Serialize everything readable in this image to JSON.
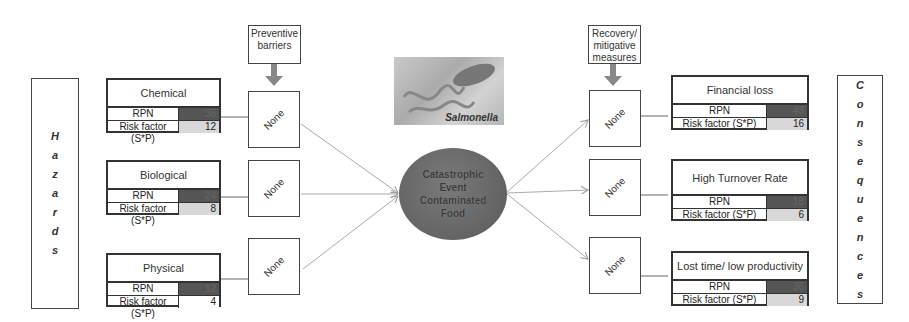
{
  "left_panel": {
    "label": "Hazards",
    "letters": [
      "H",
      "a",
      "z",
      "a",
      "r",
      "d",
      "s"
    ]
  },
  "right_panel": {
    "label": "Consequences",
    "letters": [
      "C",
      "o",
      "n",
      "s",
      "e",
      "q",
      "u",
      "e",
      "n",
      "c",
      "e",
      "s"
    ]
  },
  "barriers": {
    "preventive_label": "Preventive barriers",
    "recovery_label": "Recovery/ mitigative measures",
    "preventive": [
      "None",
      "None",
      "None"
    ],
    "recovery": [
      "None",
      "None",
      "None"
    ]
  },
  "hazards": [
    {
      "title": "Chemical",
      "rpn_label": "RPN",
      "rpn": "36",
      "risk_label": "Risk factor (S*P)",
      "risk": "12"
    },
    {
      "title": "Biological",
      "rpn_label": "RPN",
      "rpn": "24",
      "risk_label": "Risk factor (S*P)",
      "risk": "8"
    },
    {
      "title": "Physical",
      "rpn_label": "RPN",
      "rpn": "12",
      "risk_label": "Risk factor (S*P)",
      "risk": "4"
    }
  ],
  "consequences": [
    {
      "title": "Financial loss",
      "rpn_label": "RPN",
      "rpn": "48",
      "risk_label": "Risk factor (S*P)",
      "risk": "16"
    },
    {
      "title": "High Turnover Rate",
      "rpn_label": "RPN",
      "rpn": "18",
      "risk_label": "Risk factor (S*P)",
      "risk": "6"
    },
    {
      "title": "Lost time/ low productivity",
      "rpn_label": "RPN",
      "rpn": "36",
      "risk_label": "Risk factor (S*P)",
      "risk": "9"
    }
  ],
  "center": {
    "event_text": "Catastrophic\nEvent\nContaminated\nFood",
    "image_caption": "Salmonella"
  },
  "colors": {
    "rpn_fill": "#555555",
    "risk_fill": "#d8d8d8",
    "event_fill": "#666666",
    "arrow": "#aaaaaa"
  }
}
